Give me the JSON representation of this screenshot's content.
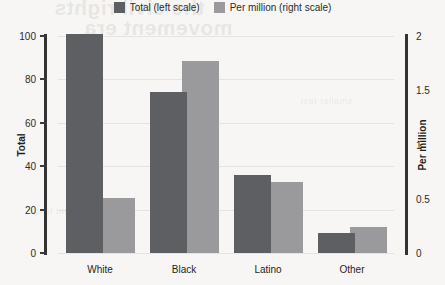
{
  "legend": {
    "items": [
      {
        "label": "Total (left scale)",
        "color": "#5d5f63",
        "icon": "legend-swatch-total"
      },
      {
        "label": "Per million (right scale)",
        "color": "#9a9a9c",
        "icon": "legend-swatch-permillion"
      }
    ]
  },
  "axes": {
    "left": {
      "label": "Total",
      "ticks": [
        "0",
        "20",
        "40",
        "60",
        "80",
        "100"
      ]
    },
    "right": {
      "label": "Per million",
      "ticks": [
        "0",
        "0.5",
        "1",
        "1.5",
        "2"
      ]
    }
  },
  "bleed_text": {
    "line1": "the civil rights",
    "line2": "movement era",
    "line3": "smaller text",
    "line4": "faint text"
  },
  "chart_data": {
    "type": "bar",
    "title": "",
    "subtitle": "",
    "xlabel": "",
    "ylabel": "Total",
    "y2label": "Per million",
    "categories": [
      "White",
      "Black",
      "Latino",
      "Other"
    ],
    "series": [
      {
        "name": "Total (left scale)",
        "axis": "left",
        "color": "#5d5f63",
        "values": [
          101,
          74,
          36,
          9
        ]
      },
      {
        "name": "Per million (right scale)",
        "axis": "right",
        "color": "#9a9a9c",
        "values": [
          0.51,
          1.77,
          0.65,
          0.24
        ]
      }
    ],
    "ylim": [
      0,
      100
    ],
    "y2lim": [
      0,
      2
    ],
    "yticks": [
      0,
      20,
      40,
      60,
      80,
      100
    ],
    "y2ticks": [
      0,
      0.5,
      1,
      1.5,
      2
    ],
    "grid": false,
    "legend_position": "top-center"
  }
}
